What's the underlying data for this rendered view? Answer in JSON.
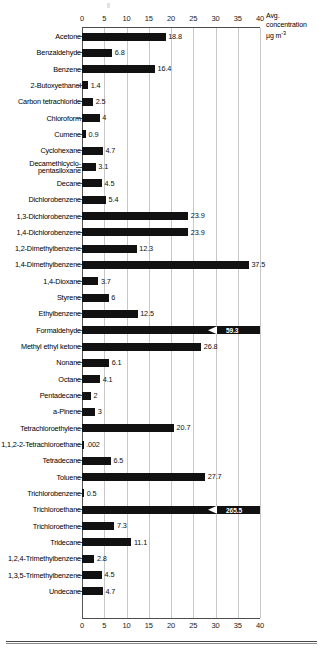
{
  "chart_data": {
    "type": "bar",
    "orientation": "horizontal",
    "title": "",
    "xlabel": "Avg. concentration µg m-3",
    "ylabel": "",
    "xlim": [
      0,
      40
    ],
    "xticks": [
      0,
      5,
      10,
      15,
      20,
      25,
      30,
      35,
      40
    ],
    "xtick_labels": [
      "0",
      "5",
      "10",
      "15",
      "20",
      "25",
      "30",
      "35",
      "40"
    ],
    "grid": true,
    "axis_top": true,
    "axis_bottom": true,
    "legend": "none",
    "bar_color": "#111111",
    "grid_color": "#c8c8c8",
    "categories": [
      "Acetone",
      "Benzaldehyde",
      "Benzene",
      "2-Butoxyethanol",
      "Carbon tetrachloride",
      "Chloroform",
      "Cumene",
      "Cyclohexane",
      "Decamethlcyclo-\npentasiloxane",
      "Decane",
      "Dichlorobenzene",
      "1,3-Dichlorobenzene",
      "1,4-Dichlorobenzene",
      "1,2-Dimethylbenzene",
      "1,4-Dimethylbenzene",
      "1,4-Dioxane",
      "Styrene",
      "Ethylbenzene",
      "Formaldehyde",
      "Methyl ethyl ketone",
      "Nonane",
      "Octane",
      "Pentadecane",
      "a-Pinene",
      "Tetrachloroethylene",
      "1,1,2-2-Tetrachloroethane",
      "Tetradecane",
      "Toluene",
      "Trichlorobenzene",
      "Trichloroethane",
      "Trichloroethene",
      "Tridecane",
      "1,2,4-Trimethylbenzene",
      "1,3,5-Trimethylbenzene",
      "Undecane"
    ],
    "values": [
      18.8,
      6.8,
      16.4,
      1.4,
      2.5,
      4,
      0.9,
      4.7,
      3.1,
      4.5,
      5.4,
      23.9,
      23.9,
      12.3,
      37.5,
      3.7,
      6,
      12.5,
      59.3,
      26.8,
      6.1,
      4.1,
      2,
      3,
      20.7,
      0.002,
      6.5,
      27.7,
      0.5,
      265.5,
      7.3,
      11.1,
      2.8,
      4.5,
      4.7
    ],
    "value_labels": [
      "18.8",
      "6.8",
      "16.4",
      "1.4",
      "2.5",
      "4",
      "0.9",
      "4.7",
      "3.1",
      "4.5",
      "5.4",
      "23.9",
      "23.9",
      "12.3",
      "37.5",
      "3.7",
      "6",
      "12.5",
      "59.3",
      "26.8",
      "6.1",
      "4.1",
      "2",
      "3",
      "20.7",
      ".002",
      "6.5",
      "27.7",
      "0.5",
      "265.5",
      "7.3",
      "11.1",
      "2.8",
      "4.5",
      "4.7"
    ],
    "overflow_indices": [
      18,
      29
    ]
  },
  "axis_title": {
    "line1": "Avg.",
    "line2": "concentration",
    "line3_base": "µg m",
    "line3_sup": "-3"
  }
}
